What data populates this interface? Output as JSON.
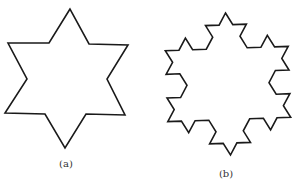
{
  "figures": [
    {
      "id": "a",
      "label": "(a)",
      "shape": "hexagram",
      "points": [
        [
          70,
          9
        ],
        [
          49,
          43
        ],
        [
          8,
          43
        ],
        [
          27,
          79
        ],
        [
          5,
          113
        ],
        [
          45,
          114
        ],
        [
          65,
          148
        ],
        [
          86,
          114
        ],
        [
          125,
          115
        ],
        [
          107,
          79
        ],
        [
          128,
          45
        ],
        [
          89,
          44
        ]
      ],
      "label_pos": [
        66,
        158
      ]
    },
    {
      "id": "b",
      "label": "(b)",
      "shape": "koch-snowflake",
      "level": 2,
      "center": [
        228,
        84
      ],
      "radius": 71,
      "rotation_deg": -2,
      "label_pos": [
        226,
        168
      ]
    }
  ],
  "colors": {
    "stroke": "#1a1a1a",
    "background": "#ffffff"
  }
}
